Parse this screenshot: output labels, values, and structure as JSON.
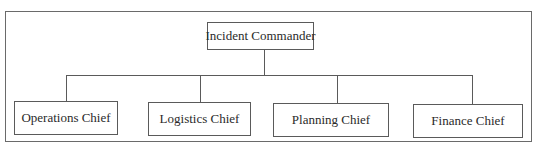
{
  "diagram": {
    "type": "org-chart",
    "root": {
      "label": "Incident Commander"
    },
    "children": [
      {
        "label": "Operations Chief"
      },
      {
        "label": "Logistics Chief"
      },
      {
        "label": "Planning Chief"
      },
      {
        "label": "Finance Chief"
      }
    ],
    "colors": {
      "line": "#5a5a5a",
      "frame": "#6a6a6a",
      "text": "#2a2a2a",
      "background": "#ffffff"
    }
  }
}
